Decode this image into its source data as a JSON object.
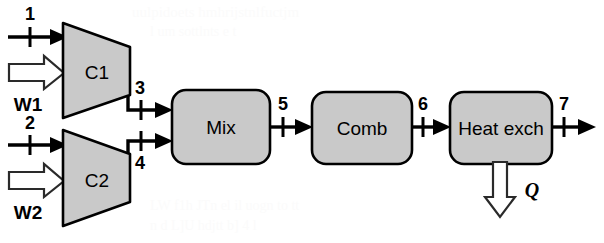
{
  "diagram": {
    "background_color": "#ffffff",
    "unit_fill_color": "#c9c9c9",
    "line_color": "#000000",
    "units": [
      {
        "id": "c1",
        "label": "C1",
        "shape": "trapezoid-compressor"
      },
      {
        "id": "c2",
        "label": "C2",
        "shape": "trapezoid-compressor"
      },
      {
        "id": "mix",
        "label": "Mix",
        "shape": "rounded-rect"
      },
      {
        "id": "comb",
        "label": "Comb",
        "shape": "rounded-rect"
      },
      {
        "id": "heatexch",
        "label": "Heat exch",
        "shape": "rounded-rect"
      }
    ],
    "streams": [
      {
        "id": "s1",
        "label": "1",
        "from": "inlet",
        "to": "c1"
      },
      {
        "id": "s2",
        "label": "2",
        "from": "inlet",
        "to": "c2"
      },
      {
        "id": "s3",
        "label": "3",
        "from": "c1",
        "to": "mix"
      },
      {
        "id": "s4",
        "label": "4",
        "from": "c2",
        "to": "mix"
      },
      {
        "id": "s5",
        "label": "5",
        "from": "mix",
        "to": "comb"
      },
      {
        "id": "s6",
        "label": "6",
        "from": "comb",
        "to": "heatexch"
      },
      {
        "id": "s7",
        "label": "7",
        "from": "heatexch",
        "to": "outlet"
      }
    ],
    "work_inputs": [
      {
        "id": "w1",
        "label": "W1",
        "into": "c1",
        "direction": "right"
      },
      {
        "id": "w2",
        "label": "W2",
        "into": "c2",
        "direction": "right"
      }
    ],
    "heat_outputs": [
      {
        "id": "q",
        "label": "Q",
        "from": "heatexch",
        "direction": "down"
      }
    ],
    "ghost_text": [
      {
        "text": "uulpidoets  hmhrijstnlfuctjm",
        "x": 132,
        "y": 4,
        "size": 15
      },
      {
        "text": "l  um   sottlnts   e      t",
        "x": 150,
        "y": 24,
        "size": 14
      },
      {
        "text": "LW  f1h  JTn  el  il uogn  to   tt",
        "x": 150,
        "y": 198,
        "size": 14
      },
      {
        "text": "n   d    L]U  hdjtt  b]  4   l",
        "x": 150,
        "y": 218,
        "size": 14
      }
    ]
  }
}
